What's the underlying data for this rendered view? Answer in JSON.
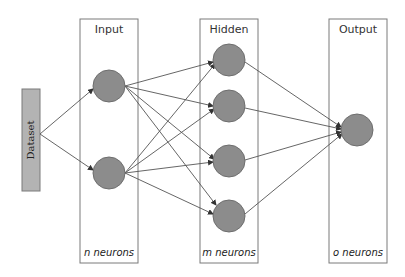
{
  "diagram": {
    "type": "neural-network",
    "dataset": {
      "label": "Dataset",
      "fill": "#b3b3b3"
    },
    "layers": [
      {
        "id": "input",
        "title": "Input",
        "count_label": "n neurons",
        "neurons": 2
      },
      {
        "id": "hidden",
        "title": "Hidden",
        "count_label": "m neurons",
        "neurons": 4
      },
      {
        "id": "output",
        "title": "Output",
        "count_label": "o neurons",
        "neurons": 1
      }
    ],
    "connections": [
      "Dataset -> Input (all)",
      "Input -> Hidden (fully connected)",
      "Hidden -> Output (fully connected)"
    ],
    "colors": {
      "neuron_fill": "#8c8c8c",
      "edge": "#555555",
      "box_stroke": "#7a7a7a"
    }
  }
}
